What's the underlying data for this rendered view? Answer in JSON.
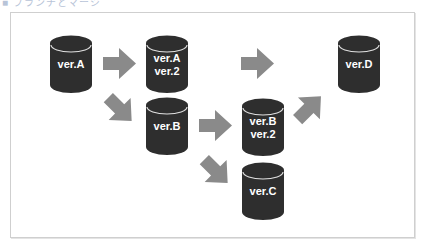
{
  "caption": "■ ブランチとマージ",
  "colors": {
    "cylinder": "#2e2e2e",
    "cylinder_rim": "#e0e0e0",
    "arrow": "#8a8a8a",
    "frame": "#cfcfcf"
  },
  "nodes": [
    {
      "id": "a",
      "lines": [
        "ver.A"
      ]
    },
    {
      "id": "a2",
      "lines": [
        "ver.A",
        "ver.2"
      ]
    },
    {
      "id": "b",
      "lines": [
        "ver.B"
      ]
    },
    {
      "id": "b2",
      "lines": [
        "ver.B",
        "ver.2"
      ]
    },
    {
      "id": "c",
      "lines": [
        "ver.C"
      ]
    },
    {
      "id": "d",
      "lines": [
        "ver.D"
      ]
    }
  ],
  "edges": [
    {
      "from": "a",
      "to": "a2",
      "direction": "right"
    },
    {
      "from": "a",
      "to": "b",
      "direction": "down-right"
    },
    {
      "from": "a2",
      "to": "d",
      "direction": "right"
    },
    {
      "from": "b",
      "to": "b2",
      "direction": "right"
    },
    {
      "from": "b",
      "to": "c",
      "direction": "down-right"
    },
    {
      "from": "b2",
      "to": "d",
      "direction": "up-right"
    }
  ]
}
